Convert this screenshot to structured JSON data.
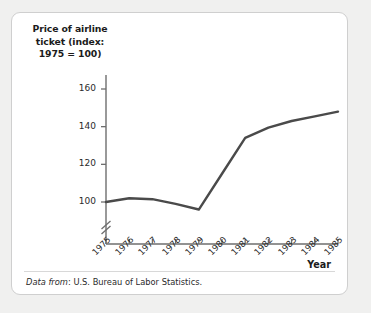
{
  "chart_data": {
    "type": "line",
    "title": "",
    "ylabel": "Price of airline ticket (index: 1975 = 100)",
    "xlabel": "Year",
    "categories": [
      "1975",
      "1976",
      "1977",
      "1978",
      "1979",
      "1980",
      "1981",
      "1982",
      "1983",
      "1984",
      "1985"
    ],
    "x": [
      1975,
      1976,
      1977,
      1978,
      1979,
      1980,
      1981,
      1982,
      1983,
      1984,
      1985
    ],
    "values": [
      100,
      102,
      101.5,
      99,
      96,
      115,
      134,
      139.5,
      143,
      145.5,
      148
    ],
    "series": [
      {
        "name": "Price of airline ticket",
        "values": [
          100,
          102,
          101.5,
          99,
          96,
          115,
          134,
          139.5,
          143,
          145.5,
          148
        ]
      }
    ],
    "yticks": [
      100,
      120,
      140,
      160
    ],
    "ytick_labels": [
      "100",
      "120",
      "140",
      "160"
    ],
    "ylim": [
      88,
      168
    ],
    "xlim": [
      1975,
      1985
    ],
    "grid": false,
    "legend": null,
    "axis_break": "y-axis break between origin and 100",
    "line_color": "#4a4a4a",
    "source_note_prefix": "Data from",
    "source_note_text": ": U.S. Bureau of Labor Statistics."
  },
  "figure": {
    "y_axis_title_lines": [
      "Price of airline",
      "ticket (index:",
      "1975 = 100)"
    ],
    "x_axis_title": "Year",
    "source_prefix": "Data from",
    "source_rest": ": U.S. Bureau of Labor Statistics.",
    "colors": {
      "line": "#4a4a4a",
      "axis": "#6e6e6e",
      "text": "#1b1b1b",
      "panel_bg": "#ffffff",
      "page_bg": "#f0f0ef",
      "border": "#cfcfcf"
    }
  }
}
